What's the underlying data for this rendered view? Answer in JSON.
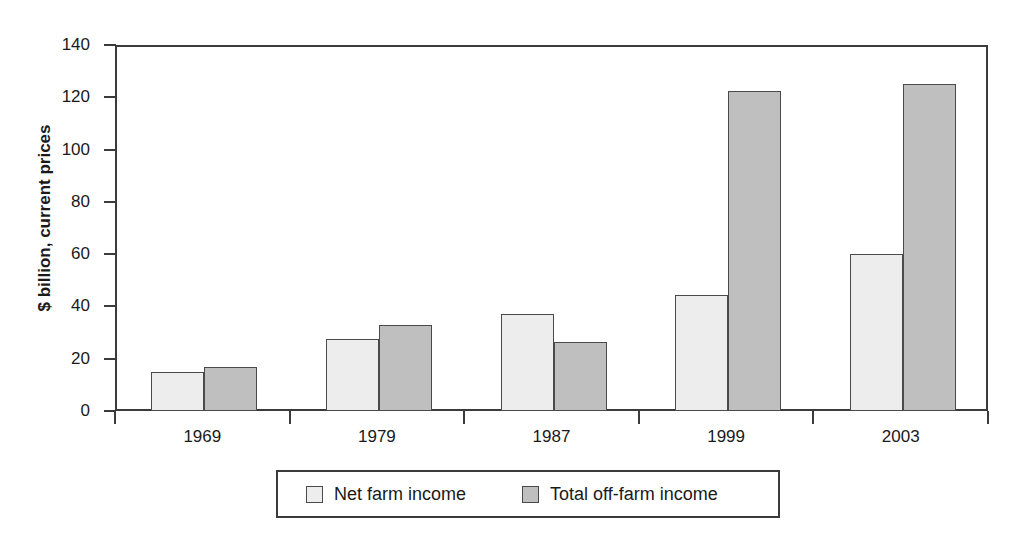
{
  "chart_data": {
    "type": "bar",
    "title": "",
    "xlabel": "",
    "ylabel": "$ billion, current prices",
    "categories": [
      "1969",
      "1979",
      "1987",
      "1999",
      "2003"
    ],
    "series": [
      {
        "name": "Net farm income",
        "values": [
          15,
          27.5,
          37,
          44.5,
          60
        ],
        "color": "#ededed"
      },
      {
        "name": "Total off-farm income",
        "values": [
          17,
          33,
          26.5,
          122.5,
          125
        ],
        "color": "#bfbfbf"
      }
    ],
    "ylim": [
      0,
      140
    ],
    "yticks": [
      0,
      20,
      40,
      60,
      80,
      100,
      120,
      140
    ],
    "ytick_labels": [
      "0",
      "20",
      "40",
      "60",
      "80",
      "100",
      "120",
      "140"
    ],
    "grid": false,
    "legend_position": "bottom"
  },
  "legend": {
    "items": [
      {
        "label": "Net farm income",
        "swatch": "light"
      },
      {
        "label": "Total off-farm income",
        "swatch": "dark"
      }
    ]
  },
  "axis": {
    "y_title": "$ billion, current prices"
  }
}
